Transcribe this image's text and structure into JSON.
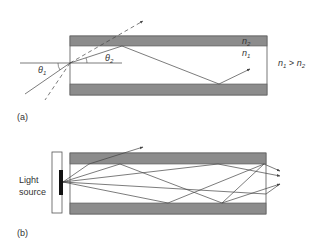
{
  "panel_a": {
    "label": "(a)",
    "cladding_label": "n",
    "cladding_sub": "2",
    "core_label": "n",
    "core_sub": "1",
    "theta1": "θ",
    "theta1_sub": "1",
    "theta2": "θ",
    "theta2_sub": "2",
    "condition_n1": "n",
    "condition_n1_sub": "1",
    "condition_op": " > ",
    "condition_n2": "n",
    "condition_n2_sub": "2"
  },
  "panel_b": {
    "label": "(b)",
    "source_line1": "Light",
    "source_line2": "source"
  },
  "colors": {
    "cladding": "#8c8c8c",
    "line": "#444444",
    "source_emitter": "#111111"
  }
}
